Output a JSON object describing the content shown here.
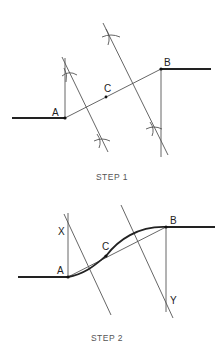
{
  "step1": {
    "caption": "STEP 1",
    "labels": {
      "a": "A",
      "b": "B",
      "c": "C"
    }
  },
  "step2": {
    "caption": "STEP 2",
    "labels": {
      "a": "A",
      "b": "B",
      "c": "C",
      "x": "X",
      "y": "Y"
    }
  },
  "colors": {
    "line": "#222222",
    "construction": "#555555",
    "background": "#ffffff"
  }
}
